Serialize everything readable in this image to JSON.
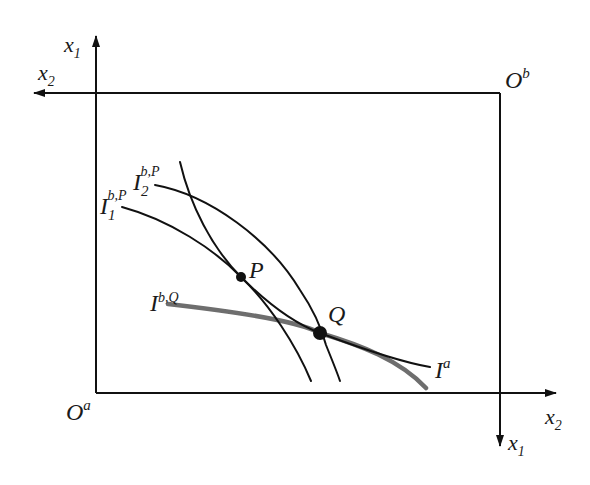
{
  "diagram": {
    "type": "edgeworth-box",
    "colors": {
      "line": "#111111",
      "highlight_curve": "#6e6e6e",
      "background": "#ffffff"
    },
    "axes": {
      "origin_a": {
        "base": "O",
        "sup": "a"
      },
      "origin_b": {
        "base": "O",
        "sup": "b"
      },
      "a_vertical": {
        "base": "x",
        "sub": "1"
      },
      "a_horizontal": {
        "base": "x",
        "sub": "2"
      },
      "b_vertical": {
        "base": "x",
        "sub": "1"
      },
      "b_horizontal": {
        "base": "x",
        "sub": "2"
      }
    },
    "curves": {
      "i1_bp": {
        "base": "I",
        "sub": "1",
        "sup": "b,P"
      },
      "i2_bp": {
        "base": "I",
        "sub": "2",
        "sup": "b,P"
      },
      "i_bq": {
        "base": "I",
        "sup": "b,Q"
      },
      "i_a": {
        "base": "I",
        "sup": "a"
      }
    },
    "points": {
      "p": {
        "label": "P"
      },
      "q": {
        "label": "Q"
      }
    }
  }
}
